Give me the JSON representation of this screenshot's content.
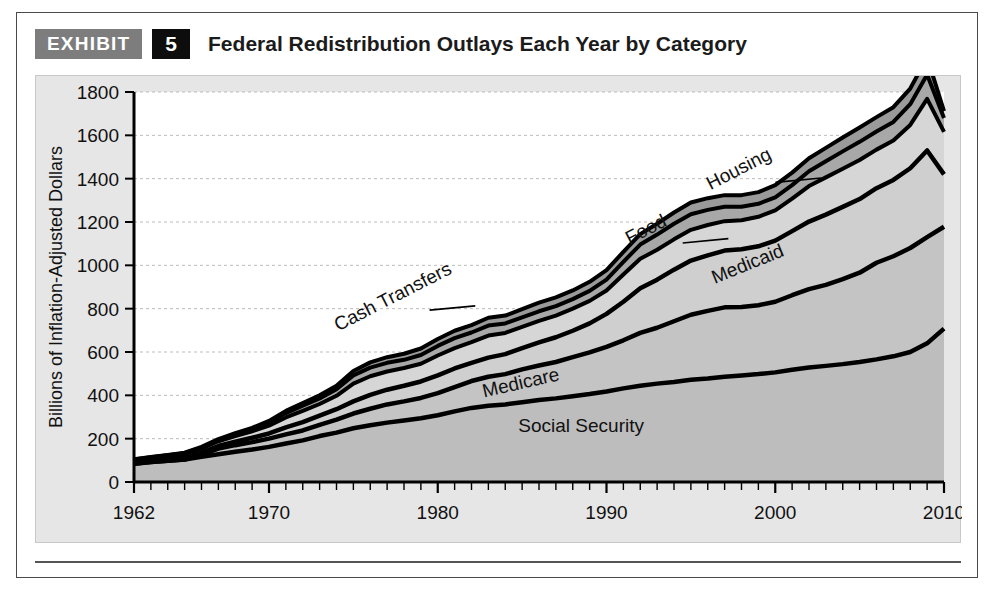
{
  "exhibit": {
    "tag_label": "EXHIBIT",
    "number": "5",
    "title": "Federal Redistribution Outlays Each Year by Category"
  },
  "colors": {
    "panel_background": "#e6e6e6",
    "plot_background": "#ffffff",
    "outline": "#000000",
    "social_security_fill": "#bdbdbd",
    "medicare_fill": "#c4c4c4",
    "medicaid_fill": "#cfcfcf",
    "cash_transfers_fill": "#d6d6d6",
    "food_fill": "#a8a8a8",
    "housing_fill": "#9a9a9a",
    "gridline": "#bbbbbb",
    "exhibit_tag_background": "#7d7d7d",
    "exhibit_number_background": "#0d0d0d"
  },
  "chart_data": {
    "type": "area",
    "stacked": true,
    "title": "Federal Redistribution Outlays Each Year by Category",
    "xlabel": "",
    "ylabel": "Billions of Inflation-Adjusted Dollars",
    "xlim": [
      1962,
      2010
    ],
    "ylim": [
      0,
      1800
    ],
    "ytick_values": [
      0,
      200,
      400,
      600,
      800,
      1000,
      1200,
      1400,
      1600,
      1800
    ],
    "ytick_labels": [
      "0",
      "200",
      "400",
      "600",
      "800",
      "1000",
      "1200",
      "1400",
      "1600",
      "1800"
    ],
    "xtick_labels": [
      "1962",
      "1970",
      "1980",
      "1990",
      "2000",
      "2010"
    ],
    "xtick_values": [
      1962,
      1970,
      1980,
      1990,
      2000,
      2010
    ],
    "minor_xtick_interval": 1,
    "grid": true,
    "legend": "inline-labels",
    "x": [
      1962,
      1963,
      1964,
      1965,
      1966,
      1967,
      1968,
      1969,
      1970,
      1971,
      1972,
      1973,
      1974,
      1975,
      1976,
      1977,
      1978,
      1979,
      1980,
      1981,
      1982,
      1983,
      1984,
      1985,
      1986,
      1987,
      1988,
      1989,
      1990,
      1991,
      1992,
      1993,
      1994,
      1995,
      1996,
      1997,
      1998,
      1999,
      2000,
      2001,
      2002,
      2003,
      2004,
      2005,
      2006,
      2007,
      2008,
      2009,
      2010
    ],
    "series": [
      {
        "name": "Social Security",
        "values": [
          84,
          92,
          98,
          104,
          116,
          128,
          140,
          150,
          162,
          178,
          192,
          212,
          228,
          248,
          262,
          274,
          284,
          294,
          308,
          326,
          342,
          352,
          358,
          368,
          378,
          386,
          396,
          406,
          418,
          432,
          444,
          454,
          462,
          472,
          478,
          486,
          492,
          498,
          506,
          518,
          528,
          536,
          544,
          554,
          566,
          580,
          600,
          640,
          708
        ]
      },
      {
        "name": "Medicare",
        "values": [
          0,
          0,
          0,
          0,
          10,
          26,
          30,
          34,
          38,
          42,
          46,
          52,
          60,
          68,
          76,
          84,
          88,
          94,
          102,
          112,
          124,
          134,
          140,
          152,
          160,
          168,
          180,
          192,
          206,
          222,
          244,
          258,
          280,
          300,
          312,
          320,
          316,
          318,
          326,
          344,
          362,
          374,
          392,
          412,
          446,
          462,
          480,
          490,
          470
        ]
      },
      {
        "name": "Medicaid",
        "values": [
          6,
          7,
          8,
          9,
          10,
          12,
          16,
          20,
          24,
          32,
          38,
          42,
          48,
          56,
          64,
          68,
          72,
          76,
          82,
          86,
          84,
          88,
          92,
          98,
          106,
          114,
          122,
          134,
          152,
          178,
          206,
          222,
          238,
          250,
          256,
          262,
          266,
          272,
          282,
          296,
          312,
          324,
          334,
          340,
          344,
          352,
          368,
          400,
          242
        ]
      },
      {
        "name": "Cash Transfers",
        "values": [
          12,
          13,
          14,
          16,
          18,
          22,
          26,
          30,
          36,
          46,
          52,
          54,
          62,
          82,
          86,
          84,
          82,
          82,
          92,
          94,
          96,
          102,
          98,
          98,
          100,
          100,
          102,
          104,
          108,
          126,
          136,
          138,
          140,
          142,
          140,
          136,
          134,
          136,
          140,
          150,
          164,
          172,
          176,
          180,
          178,
          182,
          200,
          238,
          196
        ]
      },
      {
        "name": "Food",
        "values": [
          2,
          2,
          3,
          4,
          5,
          6,
          8,
          10,
          14,
          20,
          24,
          26,
          30,
          38,
          40,
          40,
          38,
          40,
          44,
          46,
          44,
          46,
          44,
          44,
          44,
          44,
          44,
          46,
          50,
          58,
          66,
          70,
          72,
          72,
          70,
          66,
          62,
          60,
          60,
          62,
          68,
          74,
          80,
          84,
          84,
          86,
          96,
          112,
          64
        ]
      },
      {
        "name": "Housing",
        "values": [
          1,
          1,
          2,
          2,
          3,
          4,
          5,
          6,
          8,
          10,
          12,
          14,
          16,
          20,
          24,
          26,
          28,
          30,
          32,
          34,
          34,
          36,
          36,
          38,
          40,
          40,
          40,
          42,
          44,
          46,
          48,
          50,
          52,
          54,
          54,
          54,
          54,
          54,
          56,
          58,
          60,
          62,
          64,
          66,
          66,
          68,
          72,
          80,
          32
        ]
      }
    ],
    "series_label_positions": [
      {
        "name": "Social Security",
        "x": 1988.5,
        "y": 230,
        "rotation": 0,
        "leader": false
      },
      {
        "name": "Medicare",
        "x": 1985.0,
        "y": 430,
        "rotation": -13,
        "leader": false
      },
      {
        "name": "Medicaid",
        "x": 1998.5,
        "y": 980,
        "rotation": -22,
        "leader": false
      },
      {
        "name": "Cash Transfers",
        "x": 1977.5,
        "y": 830,
        "rotation": -27,
        "leader": true
      },
      {
        "name": "Food",
        "x": 1992.5,
        "y": 1140,
        "rotation": -27,
        "leader": true
      },
      {
        "name": "Housing",
        "x": 1998.0,
        "y": 1420,
        "rotation": -27,
        "leader": true
      }
    ]
  }
}
